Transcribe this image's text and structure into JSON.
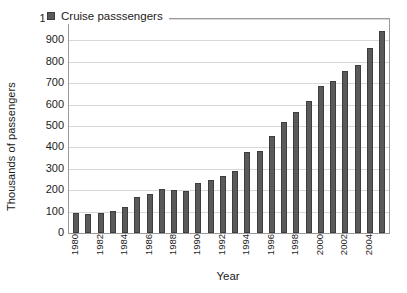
{
  "chart_data": {
    "type": "bar",
    "title": "",
    "xlabel": "Year",
    "ylabel": "Thousands of passengers",
    "legend": [
      "Cruise passsengers"
    ],
    "legend_position": "top-left-inside",
    "grid": true,
    "ylim": [
      0,
      1000
    ],
    "ytick_step": 100,
    "yticks": [
      1000,
      900,
      800,
      700,
      600,
      500,
      400,
      300,
      200,
      100,
      0
    ],
    "categories": [
      "1980",
      "1981",
      "1982",
      "1983",
      "1984",
      "1985",
      "1986",
      "1987",
      "1988",
      "1989",
      "1990",
      "1991",
      "1992",
      "1993",
      "1994",
      "1995",
      "1996",
      "1997",
      "1998",
      "1999",
      "2000",
      "2001",
      "2002",
      "2003",
      "2004",
      "2005"
    ],
    "xtick_labels": [
      "1980",
      "",
      "1982",
      "",
      "1984",
      "",
      "1986",
      "",
      "1988",
      "",
      "1990",
      "",
      "1992",
      "",
      "1994",
      "",
      "1996",
      "",
      "1998",
      "",
      "2000",
      "",
      "2002",
      "",
      "2004",
      ""
    ],
    "values": [
      95,
      90,
      92,
      103,
      120,
      166,
      183,
      205,
      203,
      198,
      232,
      248,
      268,
      290,
      378,
      385,
      455,
      520,
      565,
      615,
      685,
      710,
      755,
      785,
      865,
      945
    ],
    "series": [
      {
        "name": "Cruise passsengers",
        "color": "#5a5a5a",
        "values": [
          95,
          90,
          92,
          103,
          120,
          166,
          183,
          205,
          203,
          198,
          232,
          248,
          268,
          290,
          378,
          385,
          455,
          520,
          565,
          615,
          685,
          710,
          755,
          785,
          865,
          945
        ]
      }
    ]
  },
  "colors": {
    "bar_fill": "#5a5a5a",
    "bar_edge": "#3d3d3d",
    "grid": "#d8d8d8",
    "frame": "#9a9a9a",
    "background": "#ffffff",
    "text": "#1c1c1c"
  }
}
